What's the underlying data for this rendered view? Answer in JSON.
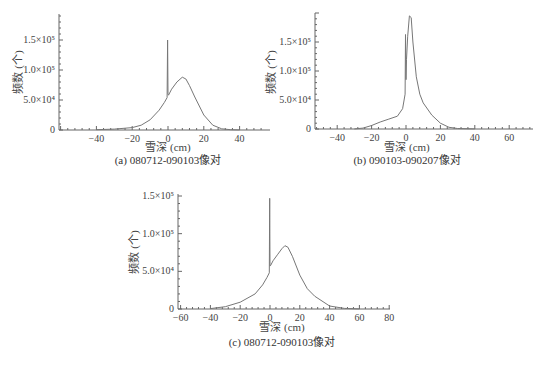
{
  "chart_data": [
    {
      "id": "a",
      "type": "line",
      "title": "",
      "caption": "(a) 080712-090103像对",
      "xlabel": "雪深 (cm)",
      "ylabel": "频数 (个)",
      "xlim": [
        -60,
        55
      ],
      "ylim": [
        0,
        190000
      ],
      "x_ticks": [
        -40,
        -20,
        0,
        20,
        40
      ],
      "x_tick_labels": [
        "−40",
        "−20",
        "0",
        "20",
        "40"
      ],
      "y_ticks": [
        0,
        50000,
        100000,
        150000
      ],
      "y_tick_labels": [
        "0",
        "5.0×10⁴",
        "1.0×10⁵",
        "1.5×10⁵"
      ],
      "grid": false,
      "legend": null,
      "series": [
        {
          "name": "frequency",
          "x": [
            -40,
            -30,
            -20,
            -15,
            -10,
            -5,
            -2,
            -0.5,
            -0.2,
            0,
            0.3,
            2,
            5,
            8,
            10,
            12,
            15,
            20,
            25,
            30,
            35,
            40
          ],
          "y": [
            500,
            1500,
            4000,
            8000,
            17000,
            33000,
            46000,
            54000,
            150000,
            60000,
            58000,
            68000,
            80000,
            88000,
            85000,
            74000,
            55000,
            25000,
            8000,
            2000,
            500,
            100
          ]
        }
      ],
      "annotations": [
        "spike at 0 cm ≈1.5×10⁵",
        "peak ≈8.8×10⁴ at ≈8 cm"
      ]
    },
    {
      "id": "b",
      "type": "line",
      "title": "",
      "caption": "(b) 090103-090207像对",
      "xlabel": "雪深 (cm)",
      "ylabel": "频数 (个)",
      "xlim": [
        -53,
        72
      ],
      "ylim": [
        0,
        200000
      ],
      "x_ticks": [
        -40,
        -20,
        0,
        20,
        40,
        60
      ],
      "x_tick_labels": [
        "−40",
        "−20",
        "0",
        "20",
        "40",
        "60"
      ],
      "y_ticks": [
        0,
        50000,
        100000,
        150000
      ],
      "y_tick_labels": [
        "0",
        "5.0×10⁴",
        "1.0×10⁵",
        "1.5×10⁵"
      ],
      "grid": false,
      "legend": null,
      "series": [
        {
          "name": "frequency",
          "x": [
            -30,
            -25,
            -20,
            -15,
            -10,
            -5,
            -2,
            -0.5,
            -0.3,
            0,
            0.3,
            1,
            2,
            3,
            4,
            6,
            8,
            10,
            15,
            20,
            25,
            30,
            40
          ],
          "y": [
            200,
            1500,
            6000,
            12000,
            17000,
            22000,
            35000,
            60000,
            163000,
            85000,
            120000,
            160000,
            195000,
            192000,
            150000,
            90000,
            60000,
            45000,
            24000,
            10000,
            3000,
            800,
            100
          ]
        }
      ],
      "annotations": [
        "spike at 0 cm ≈1.63×10⁵",
        "peak ≈1.95×10⁵ at ≈2 cm"
      ]
    },
    {
      "id": "c",
      "type": "line",
      "title": "",
      "caption": "(c) 080712-090103像对",
      "xlabel": "雪深 (cm)",
      "ylabel": "频数 (个)",
      "xlim": [
        -62,
        80
      ],
      "ylim": [
        0,
        150000
      ],
      "x_ticks": [
        -60,
        -40,
        -20,
        0,
        20,
        40,
        60,
        80
      ],
      "x_tick_labels": [
        "−60",
        "−40",
        "−20",
        "0",
        "20",
        "40",
        "60",
        "80"
      ],
      "y_ticks": [
        0,
        50000,
        100000,
        150000
      ],
      "y_tick_labels": [
        "0",
        "5.0×10⁴",
        "1.0×10⁵",
        "1.5×10⁵"
      ],
      "grid": false,
      "legend": null,
      "series": [
        {
          "name": "frequency",
          "x": [
            -40,
            -30,
            -20,
            -10,
            -5,
            -2,
            -0.5,
            -0.2,
            0,
            0.5,
            2,
            5,
            8,
            10,
            12,
            15,
            20,
            25,
            30,
            40,
            50,
            60
          ],
          "y": [
            500,
            3000,
            9000,
            20000,
            32000,
            42000,
            48000,
            147000,
            57000,
            58000,
            64000,
            72000,
            80000,
            84000,
            82000,
            70000,
            45000,
            27000,
            17000,
            4000,
            800,
            100
          ]
        }
      ],
      "annotations": [
        "spike at 0 cm ≈1.47×10⁵",
        "peak ≈8.4×10⁴ at ≈10 cm"
      ]
    }
  ]
}
